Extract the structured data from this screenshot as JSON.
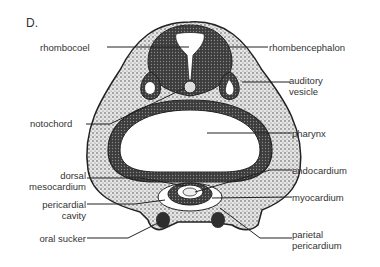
{
  "figure": {
    "panel_label": "D."
  },
  "labels": {
    "left": {
      "rhombocoel": "rhombocoel",
      "notochord": "notochord",
      "dorsal_mesocardium_1": "dorsal",
      "dorsal_mesocardium_2": "mesocardium",
      "pericardial_cavity_1": "pericardial",
      "pericardial_cavity_2": "cavity",
      "oral_sucker": "oral sucker"
    },
    "right": {
      "rhombencephalon": "rhombencephalon",
      "auditory_vesicle_1": "auditory",
      "auditory_vesicle_2": "vesicle",
      "pharynx": "pharynx",
      "endocardium": "endocardium",
      "myocardium": "myocardium",
      "parietal_pericardium_1": "parietal",
      "parietal_pericardium_2": "pericardium"
    }
  },
  "colors": {
    "ink": "#2a2a2a",
    "tissue_dark": "#3a3a3a",
    "tissue_light": "#d8d8d8",
    "background": "#ffffff"
  }
}
